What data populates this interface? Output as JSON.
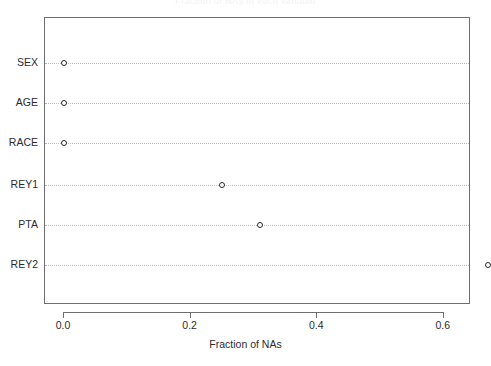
{
  "chart_data": {
    "type": "scatter",
    "title": "Fraction of NAs in each variable",
    "xlabel": "Fraction of NAs",
    "ylabel": "",
    "categories": [
      "SEX",
      "AGE",
      "RACE",
      "REY1",
      "PTA",
      "REY2"
    ],
    "values": [
      0.0,
      0.0,
      0.0,
      0.25,
      0.31,
      0.67
    ],
    "xlim": [
      -0.03,
      0.7
    ],
    "xticks": [
      0.0,
      0.2,
      0.4,
      0.6
    ],
    "xticklabels": [
      "0.0",
      "0.2",
      "0.4",
      "0.6"
    ],
    "grid": "horizontal-dotted",
    "legend": null,
    "marker": "open-circle",
    "colors": {
      "background": "#ffffff",
      "axis": "#6e6e72",
      "grid": "#b9b9bd",
      "marker_edge": "#2a2a2e",
      "text": "#2b2b2f"
    }
  },
  "axis": {
    "x_title": "Fraction of NAs",
    "tick_labels": [
      "0.0",
      "0.2",
      "0.4",
      "0.6"
    ]
  },
  "rows": [
    {
      "label": "SEX",
      "value": 0.0
    },
    {
      "label": "AGE",
      "value": 0.0
    },
    {
      "label": "RACE",
      "value": 0.0
    },
    {
      "label": "REY1",
      "value": 0.25
    },
    {
      "label": "PTA",
      "value": 0.31
    },
    {
      "label": "REY2",
      "value": 0.67
    }
  ],
  "title": "Fraction of NAs in each variable"
}
